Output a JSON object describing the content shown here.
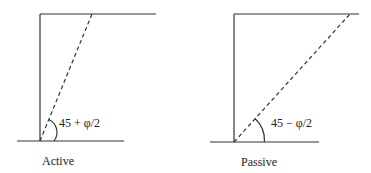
{
  "panels": [
    {
      "id": "active",
      "caption": "Active",
      "angle_label": "45 + φ/2"
    },
    {
      "id": "passive",
      "caption": "Passive",
      "angle_label": "45 − φ/2"
    }
  ],
  "colors": {
    "line": "#333333",
    "background": "#ffffff"
  }
}
